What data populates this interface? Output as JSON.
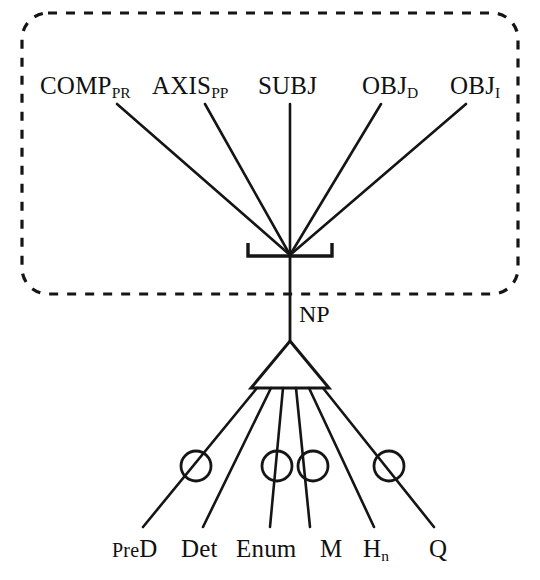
{
  "diagram": {
    "stroke_color": "#151515",
    "background_color": "#ffffff",
    "dashed_box": {
      "name": "argument-frame-box",
      "style": "dashed-rounded-rectangle",
      "x": 22,
      "y": 13,
      "width": 496,
      "height": 281,
      "corner_radius": 26,
      "dash": "9 9"
    },
    "junction": {
      "x": 290,
      "y": 255
    },
    "bracket": {
      "name": "valency-bracket",
      "left_x": 248,
      "right_x": 332,
      "y": 256,
      "tick_height": 13
    },
    "triangle": {
      "name": "np-expansion-triangle",
      "apex_x": 290,
      "apex_y": 341,
      "left_x": 251,
      "right_x": 329,
      "base_y": 388
    },
    "upper_labels": [
      {
        "name": "comp-pr",
        "text": "COMP",
        "sub": "PR",
        "x": 40,
        "y": 95,
        "line_from_x": 117,
        "line_from_y": 104
      },
      {
        "name": "axis-pp",
        "text": "AXIS",
        "sub": "PP",
        "x": 152,
        "y": 95,
        "line_from_x": 205,
        "line_from_y": 104
      },
      {
        "name": "subj",
        "text": "SUBJ",
        "sub": "",
        "x": 258,
        "y": 95,
        "line_from_x": 290,
        "line_from_y": 104
      },
      {
        "name": "obj-d",
        "text": "OBJ",
        "sub": "D",
        "x": 362,
        "y": 95,
        "line_from_x": 381,
        "line_from_y": 104
      },
      {
        "name": "obj-i",
        "text": "OBJ",
        "sub": "I",
        "x": 450,
        "y": 95,
        "line_from_x": 466,
        "line_from_y": 104
      }
    ],
    "np_label": {
      "name": "np",
      "text": "NP",
      "x": 299,
      "y": 302
    },
    "lower_labels": [
      {
        "name": "pred",
        "text": "PreD",
        "pre": "Pre",
        "post": "D",
        "sub": "",
        "x": 112,
        "y": 536,
        "line_to_x": 143,
        "line_to_y": 527,
        "circle": true,
        "circle_x": 196,
        "circle_y": 466
      },
      {
        "name": "det",
        "text": "Det",
        "pre": "",
        "post": "",
        "sub": "",
        "x": 181,
        "y": 536,
        "line_to_x": 203,
        "line_to_y": 527,
        "circle": false,
        "circle_x": 0,
        "circle_y": 0
      },
      {
        "name": "enum",
        "text": "Enum",
        "pre": "",
        "post": "",
        "sub": "",
        "x": 236,
        "y": 536,
        "line_to_x": 270,
        "line_to_y": 527,
        "circle": true,
        "circle_x": 277,
        "circle_y": 466
      },
      {
        "name": "m",
        "text": "M",
        "pre": "",
        "post": "",
        "sub": "",
        "x": 320,
        "y": 536,
        "line_to_x": 310,
        "line_to_y": 527,
        "circle": true,
        "circle_x": 313,
        "circle_y": 466
      },
      {
        "name": "h-n",
        "text": "H",
        "pre": "",
        "post": "",
        "sub": "n",
        "x": 363,
        "y": 536,
        "line_to_x": 374,
        "line_to_y": 527,
        "circle": false,
        "circle_x": 0,
        "circle_y": 0
      },
      {
        "name": "q",
        "text": "Q",
        "pre": "",
        "post": "",
        "sub": "",
        "x": 429,
        "y": 536,
        "line_to_x": 434,
        "line_to_y": 527,
        "circle": true,
        "circle_x": 389,
        "circle_y": 466
      }
    ],
    "circle_radius": 15,
    "stem": {
      "from_y": 255,
      "to_y": 341
    }
  }
}
